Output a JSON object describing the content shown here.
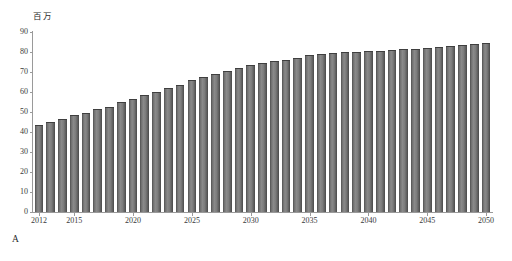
{
  "figure": {
    "panel_label": "A",
    "unit_label": "百万"
  },
  "chart_data": {
    "type": "bar",
    "title": "",
    "subtitle": "",
    "xlabel": "",
    "ylabel": "百万",
    "ylim": [
      0,
      90
    ],
    "xlim": [
      2012,
      2050
    ],
    "grid": false,
    "legend": null,
    "bar_color": "#6d6d6d",
    "axis_color": "#9a9a9a",
    "y_ticks": [
      0,
      10,
      20,
      30,
      40,
      50,
      60,
      70,
      80,
      90
    ],
    "y_tick_labels": [
      "0",
      "10",
      "20",
      "30",
      "40",
      "50",
      "60",
      "70",
      "80",
      "90"
    ],
    "x_ticks": [
      2012,
      2015,
      2020,
      2025,
      2030,
      2035,
      2040,
      2045,
      2050
    ],
    "x_tick_labels": [
      "2012",
      "2015",
      "2020",
      "2025",
      "2030",
      "2035",
      "2040",
      "2045",
      "2050"
    ],
    "categories": [
      2012,
      2013,
      2014,
      2015,
      2016,
      2017,
      2018,
      2019,
      2020,
      2021,
      2022,
      2023,
      2024,
      2025,
      2026,
      2027,
      2028,
      2029,
      2030,
      2031,
      2032,
      2033,
      2034,
      2035,
      2036,
      2037,
      2038,
      2039,
      2040,
      2041,
      2042,
      2043,
      2044,
      2045,
      2046,
      2047,
      2048,
      2049,
      2050
    ],
    "values": [
      43.0,
      44.7,
      46.2,
      47.8,
      49.1,
      50.9,
      52.2,
      54.4,
      56.1,
      57.8,
      59.7,
      61.3,
      63.2,
      65.4,
      66.9,
      68.4,
      70.1,
      71.5,
      72.9,
      73.8,
      75.1,
      75.6,
      76.5,
      77.8,
      78.6,
      78.9,
      79.4,
      79.5,
      80.0,
      80.2,
      80.6,
      80.9,
      81.2,
      81.5,
      82.2,
      82.4,
      83.0,
      83.4,
      84.2
    ]
  }
}
